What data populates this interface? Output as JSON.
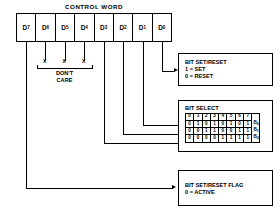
{
  "diagram": {
    "title": "CONTROL WORD",
    "register": {
      "name": "control-word-register",
      "bits": [
        {
          "base": "D",
          "sub": "7"
        },
        {
          "base": "D",
          "sub": "6"
        },
        {
          "base": "D",
          "sub": "5"
        },
        {
          "base": "D",
          "sub": "4"
        },
        {
          "base": "D",
          "sub": "3"
        },
        {
          "base": "D",
          "sub": "2"
        },
        {
          "base": "D",
          "sub": "1"
        },
        {
          "base": "D",
          "sub": "0"
        }
      ]
    },
    "dont_care": {
      "marks": [
        "X",
        "X",
        "X"
      ],
      "label_line1": "DON'T",
      "label_line2": "CARE"
    },
    "bit_set_reset": {
      "title": "BIT SET/RESET",
      "line1": "1 = SET",
      "line2": "0 = RESET"
    },
    "bit_select": {
      "title": "BIT SELECT",
      "header": [
        "0",
        "1",
        "2",
        "3",
        "4",
        "5",
        "6",
        "7"
      ],
      "rows": [
        {
          "label_base": "B",
          "label_sub": "0",
          "values": [
            "0",
            "1",
            "0",
            "1",
            "0",
            "1",
            "0",
            "1"
          ]
        },
        {
          "label_base": "B",
          "label_sub": "1",
          "values": [
            "0",
            "0",
            "1",
            "1",
            "0",
            "0",
            "1",
            "1"
          ]
        },
        {
          "label_base": "B",
          "label_sub": "2",
          "values": [
            "0",
            "0",
            "0",
            "0",
            "1",
            "1",
            "1",
            "1"
          ]
        }
      ]
    },
    "bit_set_reset_flag": {
      "title": "BIT SET/RESET FLAG",
      "line1": "0 = ACTIVE"
    },
    "colors": {
      "ink": "#000000",
      "paper": "#ffffff"
    }
  }
}
